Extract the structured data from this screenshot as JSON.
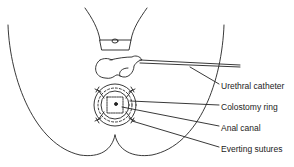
{
  "figure": {
    "labels": [
      {
        "id": "urethral-catheter",
        "text": "Urethral catheter",
        "y": 81
      },
      {
        "id": "colostomy-ring",
        "text": "Colostomy ring",
        "y": 102
      },
      {
        "id": "anal-canal",
        "text": "Anal canal",
        "y": 123
      },
      {
        "id": "everting-sutures",
        "text": "Everting sutures",
        "y": 144
      }
    ],
    "colors": {
      "line": "#222222",
      "background": "#ffffff"
    }
  }
}
